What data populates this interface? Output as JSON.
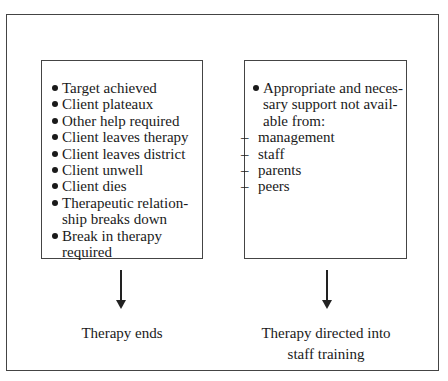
{
  "diagram": {
    "left_box": {
      "items": [
        {
          "type": "bullet",
          "text": "Target achieved"
        },
        {
          "type": "bullet",
          "text": "Client plateaux"
        },
        {
          "type": "bullet",
          "text": "Other help required"
        },
        {
          "type": "bullet",
          "text": "Client leaves therapy"
        },
        {
          "type": "bullet",
          "text": "Client leaves district"
        },
        {
          "type": "bullet",
          "text": "Client unwell"
        },
        {
          "type": "bullet",
          "text": "Client dies"
        },
        {
          "type": "bullet",
          "text": "Therapeutic relation-ship breaks down",
          "lines": [
            "Therapeutic relation-",
            "ship breaks down"
          ]
        },
        {
          "type": "bullet",
          "text": "Break in therapy required",
          "lines": [
            "Break in therapy",
            "required"
          ]
        }
      ]
    },
    "right_box": {
      "items": [
        {
          "type": "bullet",
          "text": "Appropriate and neces-sary support not avail-able from:",
          "lines": [
            "Appropriate and neces-",
            "sary support not avail-",
            "able from:"
          ]
        },
        {
          "type": "dash",
          "text": "management"
        },
        {
          "type": "dash",
          "text": "staff"
        },
        {
          "type": "dash",
          "text": "parents"
        },
        {
          "type": "dash",
          "text": "peers"
        }
      ]
    },
    "left_outcome": "Therapy ends",
    "right_outcome": [
      "Therapy directed into",
      "staff training"
    ],
    "arrow_icon": "down-arrow-icon"
  }
}
